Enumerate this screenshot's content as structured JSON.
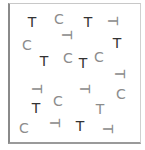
{
  "colors": {
    "dark": "#333333",
    "light": "#8c8c8c"
  },
  "items": [
    {
      "char": "T",
      "x": 32,
      "y": 22,
      "rot": 0,
      "tone": "dark"
    },
    {
      "char": "C",
      "x": 59,
      "y": 19,
      "rot": 0,
      "tone": "light"
    },
    {
      "char": "T",
      "x": 88,
      "y": 22,
      "rot": 0,
      "tone": "dark"
    },
    {
      "char": "T",
      "x": 113,
      "y": 21,
      "rot": 90,
      "tone": "light"
    },
    {
      "char": "T",
      "x": 67,
      "y": 35,
      "rot": 90,
      "tone": "light"
    },
    {
      "char": "C",
      "x": 27,
      "y": 45,
      "rot": 0,
      "tone": "light"
    },
    {
      "char": "T",
      "x": 117,
      "y": 43,
      "rot": 0,
      "tone": "dark"
    },
    {
      "char": "T",
      "x": 44,
      "y": 61,
      "rot": 0,
      "tone": "dark"
    },
    {
      "char": "C",
      "x": 68,
      "y": 58,
      "rot": 0,
      "tone": "light"
    },
    {
      "char": "T",
      "x": 83,
      "y": 63,
      "rot": 0,
      "tone": "dark"
    },
    {
      "char": "C",
      "x": 99,
      "y": 57,
      "rot": 0,
      "tone": "light"
    },
    {
      "char": "T",
      "x": 120,
      "y": 74,
      "rot": 90,
      "tone": "light"
    },
    {
      "char": "T",
      "x": 37,
      "y": 89,
      "rot": 90,
      "tone": "light"
    },
    {
      "char": "T",
      "x": 85,
      "y": 89,
      "rot": 90,
      "tone": "light"
    },
    {
      "char": "C",
      "x": 121,
      "y": 94,
      "rot": 0,
      "tone": "light"
    },
    {
      "char": "T",
      "x": 36,
      "y": 108,
      "rot": 0,
      "tone": "dark"
    },
    {
      "char": "C",
      "x": 58,
      "y": 101,
      "rot": 0,
      "tone": "light"
    },
    {
      "char": "T",
      "x": 100,
      "y": 109,
      "rot": 0,
      "tone": "light"
    },
    {
      "char": "C",
      "x": 24,
      "y": 128,
      "rot": 0,
      "tone": "light"
    },
    {
      "char": "T",
      "x": 55,
      "y": 123,
      "rot": 90,
      "tone": "light"
    },
    {
      "char": "T",
      "x": 80,
      "y": 126,
      "rot": 0,
      "tone": "dark"
    },
    {
      "char": "T",
      "x": 108,
      "y": 129,
      "rot": 90,
      "tone": "light"
    }
  ]
}
